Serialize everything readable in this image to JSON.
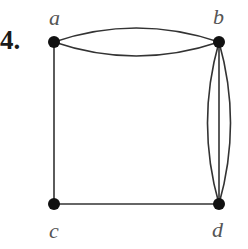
{
  "problem_number": "4.",
  "graph": {
    "nodes": [
      {
        "id": "a",
        "label": "a",
        "x": 54,
        "y": 42
      },
      {
        "id": "b",
        "label": "b",
        "x": 219,
        "y": 42
      },
      {
        "id": "c",
        "label": "c",
        "x": 54,
        "y": 204
      },
      {
        "id": "d",
        "label": "d",
        "x": 219,
        "y": 204
      }
    ],
    "edges": [
      {
        "from": "a",
        "to": "b",
        "count": 2
      },
      {
        "from": "b",
        "to": "d",
        "count": 3
      },
      {
        "from": "a",
        "to": "c",
        "count": 1
      },
      {
        "from": "c",
        "to": "d",
        "count": 1
      }
    ]
  },
  "colors": {
    "edge": "#333333",
    "node": "#111111",
    "label": "#555555"
  }
}
